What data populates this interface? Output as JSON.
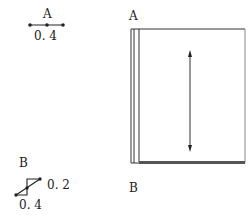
{
  "left_panel": {
    "figure_a": {
      "label": "A",
      "value": "0. 4"
    },
    "figure_b": {
      "label": "B",
      "value_side": "0. 2",
      "value_bottom": "0. 4"
    }
  },
  "right_panel": {
    "label_top": "A",
    "label_bottom": "B"
  },
  "colors": {
    "line": "#222222",
    "border_shadow": "#555555"
  }
}
